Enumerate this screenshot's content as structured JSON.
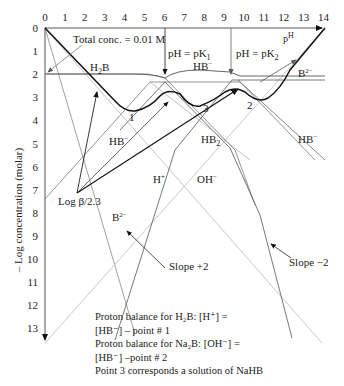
{
  "chart_data": {
    "type": "line",
    "title": "",
    "xlabel": "pH",
    "ylabel": "– Log concentration (molar)",
    "xlim": [
      0,
      14
    ],
    "ylim": [
      0,
      13
    ],
    "x_ticks": [
      "0",
      "1",
      "2",
      "3",
      "4",
      "5",
      "6",
      "7",
      "8",
      "9",
      "10",
      "11",
      "12",
      "13",
      "14"
    ],
    "y_ticks": [
      "0",
      "1",
      "2",
      "3",
      "4",
      "5",
      "6",
      "7",
      "8",
      "9",
      "10",
      "11",
      "12",
      "13"
    ],
    "total_conc": "Total conc. = 0.01 M",
    "pK1": 6,
    "pK2": 9.3,
    "series": [
      {
        "name": "H+",
        "points": [
          [
            0,
            0
          ],
          [
            13.5,
            13.5
          ]
        ]
      },
      {
        "name": "OH-",
        "points": [
          [
            0.5,
            13.5
          ],
          [
            14,
            0
          ]
        ]
      },
      {
        "name": "H2B",
        "points": [
          [
            0,
            2
          ],
          [
            5.2,
            2
          ],
          [
            9.3,
            5.3
          ],
          [
            12,
            10.2
          ]
        ]
      },
      {
        "name": "HB-",
        "points": [
          [
            0,
            7.4
          ],
          [
            5.5,
            2.1
          ],
          [
            9.5,
            2.1
          ],
          [
            14,
            6.6
          ]
        ]
      },
      {
        "name": "B2-",
        "points": [
          [
            3.5,
            13.5
          ],
          [
            6.6,
            5.8
          ],
          [
            9.3,
            2.1
          ],
          [
            14,
            2.1
          ]
        ]
      },
      {
        "name": "HB2 (Slope -2)",
        "points": [
          [
            3,
            4.8
          ],
          [
            6.6,
            2.4
          ],
          [
            9.5,
            5.6
          ],
          [
            12.6,
            13.5
          ]
        ]
      }
    ],
    "annotations": {
      "pk1_label": "pH = pK",
      "pk1_sub": "1",
      "pk2_label": "pH = pK",
      "pk2_sub": "2",
      "ph_label": "p",
      "ph_sup": "H",
      "h2b": "H",
      "h2b_sub": "2",
      "h2b_end": "B",
      "hb_top": "HB",
      "hb_top_sup": "−",
      "b2_top": "B",
      "b2_top_sup": "2−",
      "hb_mid": "HB",
      "hb_mid_sup": "−",
      "hb2": "HB",
      "hb2_sub": "2",
      "hb_right": "HB",
      "hb_right_sup": "−",
      "hplus": "H",
      "hplus_sup": "+",
      "ohminus": "OH",
      "ohminus_sup": "−",
      "b2_low": "B",
      "b2_low_sup": "2−",
      "log_beta": "Log β/2.3",
      "slope_plus": "Slope +2",
      "slope_minus": "Slope −2",
      "point1": "1",
      "point2": "2",
      "point3": "3"
    },
    "notes": [
      "Proton balance for H₂B: [H⁺] =",
      "[HB⁻] – point # 1",
      "Proton balance for Na₂B: [OH⁻] =",
      "[HB⁻] –point # 2",
      "Point 3 corresponds a solution of NaHB"
    ]
  }
}
